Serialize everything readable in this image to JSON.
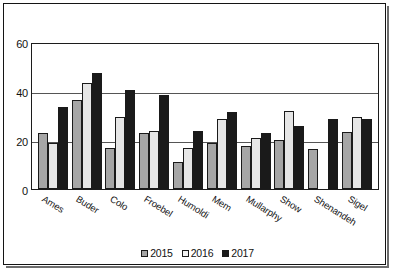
{
  "chart_data": {
    "type": "bar",
    "title": "",
    "subtitle": "",
    "xlabel": "",
    "ylabel": "",
    "ylim": [
      0,
      60
    ],
    "yticks": [
      0,
      20,
      40,
      60
    ],
    "grid": true,
    "legend_position": "bottom",
    "categories": [
      "Ames",
      "Buder",
      "Colo",
      "Froebel",
      "Humoldi",
      "Mem",
      "Mullarphy",
      "Show",
      "Shenandeh",
      "Sigel"
    ],
    "series": [
      {
        "name": "2015",
        "color": "#a6a6a6",
        "values": [
          23,
          37,
          17,
          23,
          11,
          19,
          18,
          20.5,
          16.5,
          23.5
        ]
      },
      {
        "name": "2016",
        "color": "#e6e6e6",
        "values": [
          19,
          44,
          30,
          24,
          17,
          29,
          21,
          32.5,
          null,
          30
        ]
      },
      {
        "name": "2017",
        "color": "#1a1a1a",
        "values": [
          34,
          48,
          41,
          39,
          24,
          32,
          23,
          26,
          29,
          29
        ]
      }
    ]
  },
  "axis": {
    "y_tick_labels": [
      "60",
      "40",
      "20",
      "0"
    ],
    "y_tick_values": [
      60,
      40,
      20,
      0
    ]
  },
  "legend": {
    "entries": [
      {
        "label": "2015",
        "swatch": "swatch-2015"
      },
      {
        "label": "2016",
        "swatch": "swatch-2016"
      },
      {
        "label": "2017",
        "swatch": "swatch-2017"
      }
    ]
  }
}
